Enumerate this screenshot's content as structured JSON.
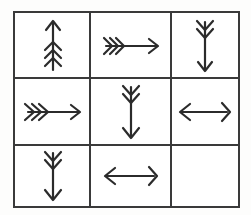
{
  "puzzle": {
    "title": "Arrow Matrix",
    "type": "visual-analogy-matrix",
    "rows": 3,
    "columns": 3,
    "frame_color": "#3a3a3a",
    "line_color": "#2b2b2b",
    "background_color": "#ffffff",
    "stroke_width": 2.2,
    "cells": [
      {
        "index": 1,
        "row": 1,
        "column": 1,
        "label": "cell-r1c1",
        "direction": "up",
        "fletching_count": 3,
        "arrowhead": "single",
        "empty": false
      },
      {
        "index": 2,
        "row": 1,
        "column": 2,
        "label": "cell-r1c2",
        "direction": "right",
        "fletching_count": 3,
        "arrowhead": "single",
        "empty": false
      },
      {
        "index": 3,
        "row": 1,
        "column": 3,
        "label": "cell-r1c3",
        "direction": "down",
        "fletching_count": 2,
        "arrowhead": "single",
        "empty": false
      },
      {
        "index": 4,
        "row": 2,
        "column": 1,
        "label": "cell-r2c1",
        "direction": "right",
        "fletching_count": 3,
        "arrowhead": "single",
        "empty": false
      },
      {
        "index": 5,
        "row": 2,
        "column": 2,
        "label": "cell-r2c2",
        "direction": "down",
        "fletching_count": 2,
        "arrowhead": "single",
        "empty": false
      },
      {
        "index": 6,
        "row": 2,
        "column": 3,
        "label": "cell-r2c3",
        "direction": "left",
        "fletching_count": 1,
        "arrowhead": "single",
        "empty": false
      },
      {
        "index": 7,
        "row": 3,
        "column": 1,
        "label": "cell-r3c1",
        "direction": "down",
        "fletching_count": 2,
        "arrowhead": "single",
        "empty": false
      },
      {
        "index": 8,
        "row": 3,
        "column": 2,
        "label": "cell-r3c2",
        "direction": "left",
        "fletching_count": 1,
        "arrowhead": "single",
        "empty": false
      },
      {
        "index": 9,
        "row": 3,
        "column": 3,
        "label": "cell-r3c3-missing",
        "direction": "none",
        "fletching_count": 0,
        "arrowhead": "none",
        "empty": true
      }
    ],
    "geometry": {
      "frame_left": 13,
      "frame_top": 11,
      "frame_width": 227,
      "frame_height": 197,
      "column_dividers": [
        75,
        156
      ],
      "row_dividers": [
        65,
        132
      ]
    }
  }
}
